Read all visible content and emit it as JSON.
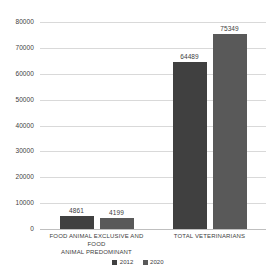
{
  "chart_data": {
    "type": "bar",
    "title": "",
    "subtitle": "",
    "xlabel": "",
    "ylabel": "",
    "ylim": [
      0,
      80000
    ],
    "yticks": [
      0,
      10000,
      20000,
      30000,
      40000,
      50000,
      60000,
      70000,
      80000
    ],
    "ytick_labels": [
      "0",
      "10000",
      "20000",
      "30000",
      "40000",
      "50000",
      "60000",
      "70000",
      "80000"
    ],
    "grid": true,
    "legend_position": "bottom-center",
    "categories": [
      "FOOD ANIMAL EXCLUSIVE AND FOOD ANIMAL PREDOMINANT",
      "TOTAL VETERINARIANS"
    ],
    "category_lines": [
      [
        "FOOD ANIMAL EXCLUSIVE AND FOOD",
        "ANIMAL PREDOMINANT"
      ],
      [
        "TOTAL VETERINARIANS"
      ]
    ],
    "series": [
      {
        "name": "2012",
        "color": "#404040",
        "values": [
          4861,
          64489
        ],
        "value_labels": [
          "4861",
          "64489"
        ]
      },
      {
        "name": "2020",
        "color": "#595959",
        "values": [
          4199,
          75349
        ],
        "value_labels": [
          "4199",
          "75349"
        ]
      }
    ]
  },
  "colors": {
    "background": "#ffffff",
    "gridline": "#d9d9d9",
    "axis": "#bfbfbf",
    "text": "#404040",
    "series_2012": "#404040",
    "series_2020": "#595959"
  }
}
